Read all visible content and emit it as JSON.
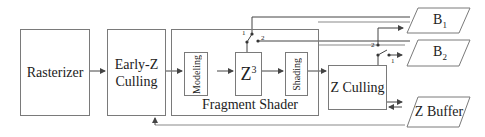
{
  "diagram": {
    "blocks": {
      "rasterizer": "Rasterizer",
      "early_z_line1": "Early-Z",
      "early_z_line2": "Culling",
      "fragment_shader": "Fragment Shader",
      "modeling": "Modeling",
      "z3_base": "Z",
      "z3_sup": "3",
      "shading": "Shading",
      "z_culling": "Z Culling"
    },
    "outputs": {
      "b1_base": "B",
      "b1_sub": "1",
      "b2_base": "B",
      "b2_sub": "2",
      "z_buffer": "Z Buffer"
    },
    "switches": {
      "z3_switch": {
        "pos1": "1",
        "pos2": "2"
      },
      "zcull_switch": {
        "pos1": "1",
        "pos2": "2"
      }
    },
    "colors": {
      "line": "#555555",
      "border": "#7a7a7a",
      "rail": "#8a8a8a"
    }
  }
}
